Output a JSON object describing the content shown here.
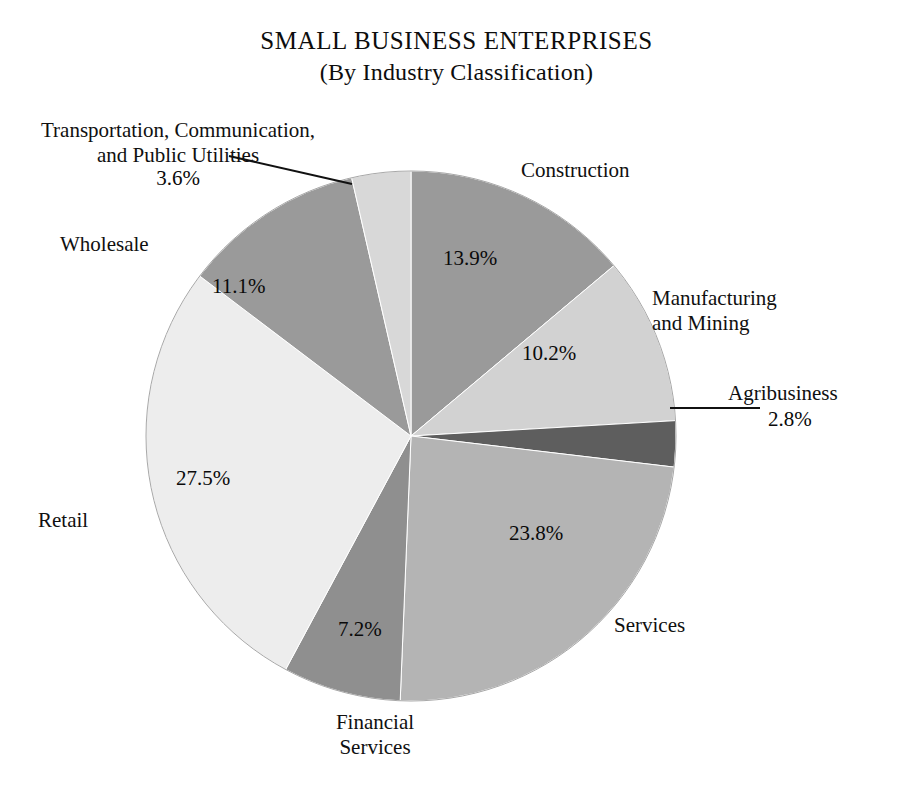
{
  "page": {
    "background": "#ffffff",
    "width": 913,
    "height": 796
  },
  "title": {
    "main": "SMALL BUSINESS ENTERPRISES",
    "subtitle": "(By Industry Classification)"
  },
  "chart_data": {
    "type": "pie",
    "title": "SMALL BUSINESS ENTERPRISES",
    "subtitle": "(By Industry Classification)",
    "xlabel": "",
    "ylabel": "",
    "units": "percent",
    "legend_position": "none",
    "labels_outside": true,
    "start_angle_deg": 0,
    "direction": "clockwise",
    "categories": [
      "Construction",
      "Manufacturing and Mining",
      "Agribusiness",
      "Services",
      "Financial Services",
      "Retail",
      "Wholesale",
      "Transportation, Communication, and Public Utilities"
    ],
    "values": [
      13.9,
      10.2,
      2.8,
      23.8,
      7.2,
      27.5,
      11.1,
      3.6
    ],
    "value_labels": [
      "13.9%",
      "10.2%",
      "2.8%",
      "23.8%",
      "7.2%",
      "27.5%",
      "11.1%",
      "3.6%"
    ],
    "colors": [
      "#9a9a9a",
      "#d2d2d2",
      "#5e5e5e",
      "#b4b4b4",
      "#8f8f8f",
      "#ededed",
      "#9a9a9a",
      "#d8d8d8"
    ],
    "total": 100.1
  },
  "slices": [
    {
      "key": "construction",
      "name": "Construction",
      "label": "Construction",
      "percent_label": "13.9%",
      "value": 13.9,
      "color": "#9a9a9a",
      "leader_line": false
    },
    {
      "key": "manufacturing",
      "name": "Manufacturing and Mining",
      "label": "Manufacturing\nand Mining",
      "percent_label": "10.2%",
      "value": 10.2,
      "color": "#d2d2d2",
      "leader_line": false
    },
    {
      "key": "agribusiness",
      "name": "Agribusiness",
      "label": "Agribusiness",
      "percent_label": "2.8%",
      "value": 2.8,
      "color": "#5e5e5e",
      "leader_line": true
    },
    {
      "key": "services",
      "name": "Services",
      "label": "Services",
      "percent_label": "23.8%",
      "value": 23.8,
      "color": "#b4b4b4",
      "leader_line": false
    },
    {
      "key": "financial",
      "name": "Financial Services",
      "label": "Financial\nServices",
      "percent_label": "7.2%",
      "value": 7.2,
      "color": "#8f8f8f",
      "leader_line": false
    },
    {
      "key": "retail",
      "name": "Retail",
      "label": "Retail",
      "percent_label": "27.5%",
      "value": 27.5,
      "color": "#ededed",
      "leader_line": false
    },
    {
      "key": "wholesale",
      "name": "Wholesale",
      "label": "Wholesale",
      "percent_label": "11.1%",
      "value": 11.1,
      "color": "#9a9a9a",
      "leader_line": false
    },
    {
      "key": "transportation",
      "name": "Transportation, Communication, and Public Utilities",
      "label": "Transportation, Communication,\nand Public Utilities",
      "percent_label": "3.6%",
      "value": 3.6,
      "color": "#d8d8d8",
      "leader_line": true
    }
  ],
  "geometry": {
    "center_x": 411,
    "center_y": 436,
    "radius": 265,
    "outline_color": "#a8a8a8"
  }
}
